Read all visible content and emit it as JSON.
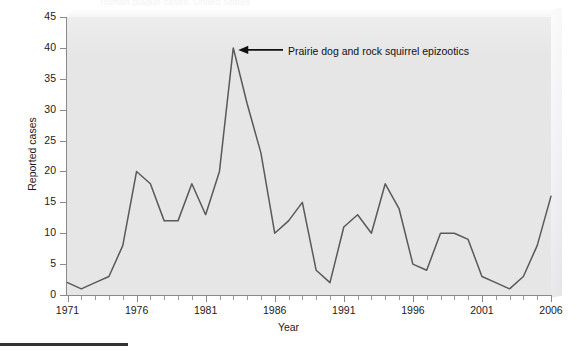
{
  "figure": {
    "cropped_title_fragment": "Human plague cases, United States",
    "bottom_rule": true
  },
  "axis": {
    "y_title": "Reported cases",
    "x_title": "Year",
    "y_ticks": [
      0,
      5,
      10,
      15,
      20,
      25,
      30,
      35,
      40,
      45
    ],
    "x_major_labels": [
      "1971",
      "1976",
      "1981",
      "1986",
      "1991",
      "1996",
      "2001",
      "2006"
    ]
  },
  "annotation": {
    "label": "Prairie dog and rock squirrel epizootics",
    "target_year": 1983,
    "target_value": 40
  },
  "colors": {
    "plot_background": "#e6e6e6",
    "line": "#595959",
    "axis": "#8a8a8a",
    "text": "#1a1a1a"
  },
  "chart_data": {
    "type": "line",
    "title": "Human plague cases, United States",
    "xlabel": "Year",
    "ylabel": "Reported cases",
    "xlim": [
      1971,
      2006
    ],
    "ylim": [
      0,
      45
    ],
    "grid": false,
    "legend": "none",
    "x": [
      1971,
      1972,
      1973,
      1974,
      1975,
      1976,
      1977,
      1978,
      1979,
      1980,
      1981,
      1982,
      1983,
      1984,
      1985,
      1986,
      1987,
      1988,
      1989,
      1990,
      1991,
      1992,
      1993,
      1994,
      1995,
      1996,
      1997,
      1998,
      1999,
      2000,
      2001,
      2002,
      2003,
      2004,
      2005,
      2006
    ],
    "series": [
      {
        "name": "Reported cases",
        "values": [
          2,
          1,
          2,
          3,
          8,
          20,
          18,
          12,
          12,
          18,
          13,
          20,
          40,
          31,
          23,
          10,
          12,
          15,
          4,
          2,
          11,
          13,
          10,
          18,
          14,
          5,
          4,
          10,
          10,
          9,
          3,
          2,
          1,
          3,
          8,
          16
        ]
      }
    ],
    "annotations": [
      {
        "text": "Prairie dog and rock squirrel epizootics",
        "x": 1983,
        "y": 40
      }
    ]
  }
}
